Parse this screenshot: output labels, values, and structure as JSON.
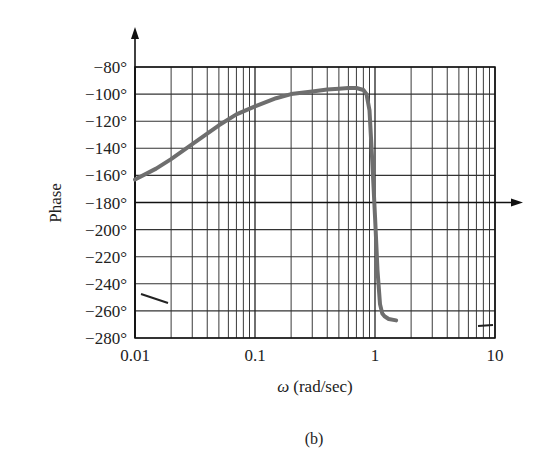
{
  "chart_data": {
    "type": "line",
    "title": "",
    "caption": "(b)",
    "xlabel_symbol": "ω",
    "xlabel_unit": "(rad/sec)",
    "ylabel": "Phase",
    "xscale": "log",
    "xlim": [
      0.01,
      10
    ],
    "ylim": [
      -280,
      -80
    ],
    "grid": true,
    "x_ticks": [
      0.01,
      0.1,
      1,
      10
    ],
    "x_tick_labels": [
      "0.01",
      "0.1",
      "1",
      "10"
    ],
    "y_ticks": [
      -80,
      -100,
      -120,
      -140,
      -160,
      -180,
      -200,
      -220,
      -240,
      -260,
      -280
    ],
    "y_tick_labels": [
      "−80°",
      "−100°",
      "−120°",
      "−140°",
      "−160°",
      "−180°",
      "−200°",
      "−220°",
      "−240°",
      "−260°",
      "−280°"
    ],
    "reference_line": {
      "axis": "y",
      "value": -180,
      "arrow": true
    },
    "series": [
      {
        "name": "Phase",
        "color": "#6e6e6e",
        "x": [
          0.01,
          0.015,
          0.02,
          0.03,
          0.05,
          0.07,
          0.1,
          0.15,
          0.2,
          0.3,
          0.4,
          0.5,
          0.6,
          0.7,
          0.8,
          0.85,
          0.9,
          0.95,
          1.0,
          1.05,
          1.1,
          1.15,
          1.2,
          1.3,
          1.5
        ],
        "y": [
          -163,
          -155,
          -148,
          -137,
          -123,
          -115,
          -109,
          -103,
          -100,
          -98,
          -96.5,
          -96,
          -95.5,
          -95.5,
          -97,
          -100,
          -112,
          -150,
          -190,
          -230,
          -255,
          -262,
          -264,
          -266,
          -267
        ]
      }
    ]
  },
  "colors": {
    "curve": "#6e6e6e",
    "grid": "#333333",
    "axis": "#111111",
    "background": "#ffffff"
  }
}
